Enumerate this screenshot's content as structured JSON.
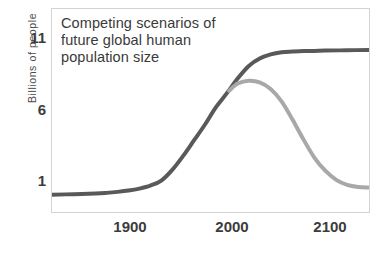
{
  "chart_data": {
    "type": "line",
    "title": "Competing scenarios of\nfuture global human\npopulation size",
    "xlabel": "",
    "ylabel": "Billions of people",
    "xlim": [
      1850,
      2140
    ],
    "ylim": [
      0,
      12.3
    ],
    "xticks": [
      1900,
      2000,
      2100
    ],
    "xtick_labels": [
      "1900",
      "2000",
      "2100"
    ],
    "yticks": [
      1,
      6,
      11
    ],
    "ytick_labels": [
      "1",
      "6",
      "11"
    ],
    "grid": false,
    "legend": "none",
    "series": [
      {
        "name": "continued-growth-scenario",
        "color": "#595959",
        "line_width": 4,
        "points": [
          [
            1850,
            1.05
          ],
          [
            1870,
            1.08
          ],
          [
            1890,
            1.12
          ],
          [
            1900,
            1.16
          ],
          [
            1910,
            1.22
          ],
          [
            1920,
            1.3
          ],
          [
            1930,
            1.42
          ],
          [
            1940,
            1.6
          ],
          [
            1950,
            1.9
          ],
          [
            1960,
            2.55
          ],
          [
            1970,
            3.4
          ],
          [
            1980,
            4.35
          ],
          [
            1990,
            5.3
          ],
          [
            2000,
            6.35
          ],
          [
            2010,
            7.2
          ],
          [
            2020,
            8.1
          ],
          [
            2030,
            8.85
          ],
          [
            2040,
            9.3
          ],
          [
            2050,
            9.55
          ],
          [
            2060,
            9.68
          ],
          [
            2070,
            9.72
          ],
          [
            2080,
            9.75
          ],
          [
            2090,
            9.76
          ],
          [
            2100,
            9.78
          ],
          [
            2120,
            9.8
          ],
          [
            2140,
            9.82
          ]
        ]
      },
      {
        "name": "decline-scenario",
        "color": "#a8a8a8",
        "line_width": 4,
        "points": [
          [
            2012,
            7.35
          ],
          [
            2020,
            7.78
          ],
          [
            2030,
            7.95
          ],
          [
            2040,
            7.85
          ],
          [
            2050,
            7.45
          ],
          [
            2060,
            6.7
          ],
          [
            2070,
            5.6
          ],
          [
            2080,
            4.4
          ],
          [
            2090,
            3.3
          ],
          [
            2100,
            2.5
          ],
          [
            2110,
            1.95
          ],
          [
            2120,
            1.65
          ],
          [
            2130,
            1.52
          ],
          [
            2140,
            1.48
          ]
        ]
      }
    ]
  },
  "axes": {
    "y_axis_title": "Billions of people",
    "y_tick_top": "11",
    "y_tick_mid": "6",
    "y_tick_bottom": "1",
    "x_tick_left": "1900",
    "x_tick_mid": "2000",
    "x_tick_right": "2100"
  },
  "colors": {
    "dark_series": "#595959",
    "light_series": "#a8a8a8",
    "frame": "#d3d3d3",
    "text": "#3c3c3c",
    "background": "#ffffff"
  }
}
